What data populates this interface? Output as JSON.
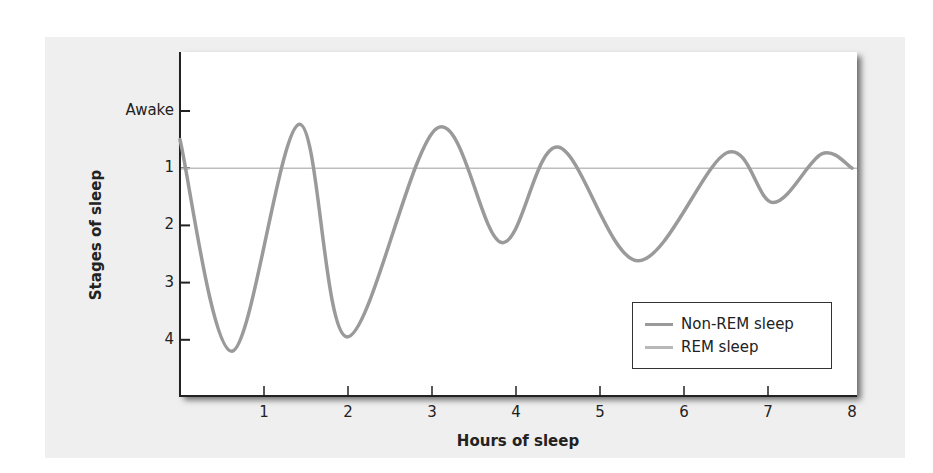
{
  "chart_data": {
    "type": "line",
    "title": "",
    "xlabel": "Hours of sleep",
    "ylabel": "Stages of sleep",
    "xlim": [
      0,
      8
    ],
    "ylim_inverted": [
      "Awake",
      4
    ],
    "x_ticks": [
      "1",
      "2",
      "3",
      "4",
      "5",
      "6",
      "7",
      "8"
    ],
    "y_ticks": [
      "Awake",
      "1",
      "2",
      "3",
      "4"
    ],
    "reference_line": {
      "y": 1,
      "label": "Stage 1"
    },
    "grid": false,
    "legend_position": "lower right",
    "legend": [
      {
        "name": "Non-REM sleep",
        "color": "#9a9a9a"
      },
      {
        "name": "REM sleep",
        "color": "#b8b8b8"
      }
    ],
    "series": [
      {
        "name": "Sleep stage cycle",
        "note": "stage 0 = Awake; larger = deeper sleep",
        "x": [
          0,
          0.62,
          1.42,
          1.99,
          3.06,
          3.83,
          4.5,
          5.45,
          6.51,
          7.06,
          7.64,
          8.0
        ],
        "y": [
          0.5,
          4.2,
          0.23,
          3.95,
          0.3,
          2.3,
          0.63,
          2.62,
          0.73,
          1.6,
          0.75,
          1.0
        ]
      }
    ]
  },
  "axes": {
    "x_title": "Hours of sleep",
    "y_title": "Stages of sleep",
    "x_ticks": [
      "1",
      "2",
      "3",
      "4",
      "5",
      "6",
      "7",
      "8"
    ],
    "y_ticks": [
      "Awake",
      "1",
      "2",
      "3",
      "4"
    ]
  },
  "legend": {
    "items": [
      {
        "label": "Non-REM sleep",
        "color": "#9a9a9a"
      },
      {
        "label": "REM sleep",
        "color": "#b8b8b8"
      }
    ]
  }
}
